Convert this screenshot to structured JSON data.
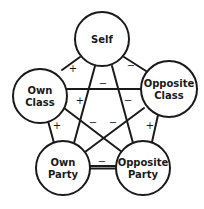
{
  "diagram": {
    "type": "signed-relationship-graph",
    "nodes": [
      {
        "id": "self",
        "lines": [
          "Self"
        ],
        "cx": 102,
        "cy": 39,
        "r": 27
      },
      {
        "id": "own_class",
        "lines": [
          "Own",
          "Class"
        ],
        "cx": 40,
        "cy": 96,
        "r": 27
      },
      {
        "id": "opposite_class",
        "lines": [
          "Opposite",
          "Class"
        ],
        "cx": 169,
        "cy": 89,
        "r": 28
      },
      {
        "id": "own_party",
        "lines": [
          "Own",
          "Party"
        ],
        "cx": 63,
        "cy": 168,
        "r": 27
      },
      {
        "id": "opposite_party",
        "lines": [
          "Opposite",
          "Party"
        ],
        "cx": 143,
        "cy": 168,
        "r": 27
      }
    ],
    "edges": [
      {
        "from": "self",
        "to": "own_class",
        "sign": "+",
        "x1": 62,
        "y1": 70,
        "x2": 80,
        "y2": 57,
        "lx": 73,
        "ly": 69
      },
      {
        "from": "self",
        "to": "opposite_class",
        "sign": "−",
        "x1": 124,
        "y1": 57,
        "x2": 146,
        "y2": 71,
        "lx": 131,
        "ly": 66
      },
      {
        "from": "own_class",
        "to": "opposite_class",
        "sign": "−",
        "x1": 67,
        "y1": 89,
        "x2": 141,
        "y2": 89,
        "lx": 103,
        "ly": 84
      },
      {
        "from": "self",
        "to": "own_party",
        "sign": "+",
        "x1": 95,
        "y1": 66,
        "x2": 74,
        "y2": 143,
        "lx": 80,
        "ly": 101
      },
      {
        "from": "self",
        "to": "opposite_party",
        "sign": "−",
        "x1": 112,
        "y1": 66,
        "x2": 133,
        "y2": 143,
        "lx": 128,
        "ly": 101
      },
      {
        "from": "own_class",
        "to": "own_party",
        "sign": "+",
        "x1": 48,
        "y1": 121,
        "x2": 54,
        "y2": 143,
        "lx": 57,
        "ly": 126
      },
      {
        "from": "opposite_class",
        "to": "opposite_party",
        "sign": "+",
        "x1": 158,
        "y1": 115,
        "x2": 152,
        "y2": 142,
        "lx": 150,
        "ly": 126
      },
      {
        "from": "own_class",
        "to": "opposite_party",
        "sign": "−",
        "x1": 64,
        "y1": 108,
        "x2": 122,
        "y2": 152,
        "lx": 93,
        "ly": 123
      },
      {
        "from": "opposite_class",
        "to": "own_party",
        "sign": "−",
        "x1": 144,
        "y1": 108,
        "x2": 85,
        "y2": 152,
        "lx": 113,
        "ly": 123
      },
      {
        "from": "own_party",
        "to": "opposite_party",
        "sign": "−",
        "x1": 90,
        "y1": 167,
        "x2": 116,
        "y2": 167,
        "lx": 102,
        "ly": 162,
        "double": true
      }
    ]
  }
}
